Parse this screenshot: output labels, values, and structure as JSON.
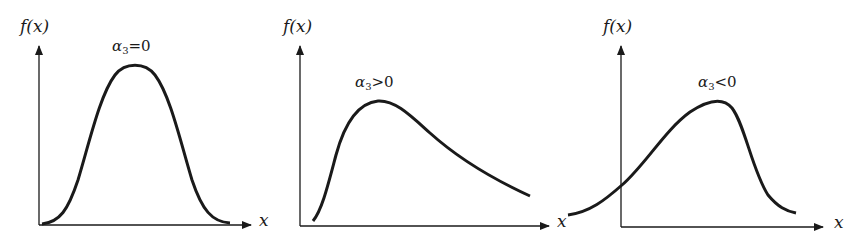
{
  "figure": {
    "panels": [
      {
        "id": "symmetric",
        "y_axis_label": "f(x)",
        "x_axis_label": "x",
        "condition": {
          "symbol": "α",
          "subscript": "3",
          "relation": "=",
          "value": "0"
        },
        "shape": "symmetric bell curve"
      },
      {
        "id": "positive-skew",
        "y_axis_label": "f(x)",
        "x_axis_label": "x",
        "condition": {
          "symbol": "α",
          "subscript": "3",
          "relation": ">",
          "value": "0"
        },
        "shape": "right-skewed (long right tail)"
      },
      {
        "id": "negative-skew",
        "y_axis_label": "f(x)",
        "x_axis_label": "x",
        "condition": {
          "symbol": "α",
          "subscript": "3",
          "relation": "<",
          "value": "0"
        },
        "shape": "left-skewed (long left tail)"
      }
    ],
    "colors": {
      "ink": "#1a1a1a",
      "background": "#ffffff"
    }
  }
}
